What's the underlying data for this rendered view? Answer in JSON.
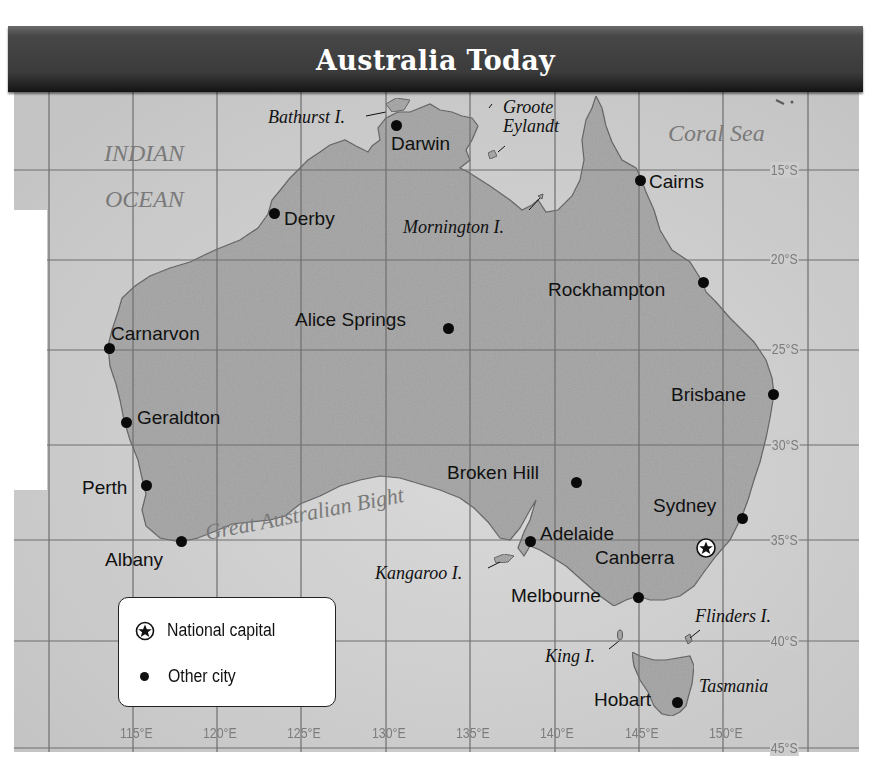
{
  "title": "Australia Today",
  "colors": {
    "land": "#a3a3a3",
    "ocean": "#cdcdcd",
    "grid": "#6e6e6e",
    "title_bar": "#3e3e3e",
    "title_text": "#ffffff",
    "ocean_label": "#7a7a7a"
  },
  "ocean_labels": [
    {
      "id": "indian-ocean-line1",
      "text": "INDIAN"
    },
    {
      "id": "indian-ocean-line2",
      "text": "OCEAN"
    },
    {
      "id": "coral-sea",
      "text": "Coral Sea"
    },
    {
      "id": "great-australian-bight",
      "text": "Great Australian Bight"
    }
  ],
  "cities": [
    {
      "name": "Darwin",
      "type": "other"
    },
    {
      "name": "Derby",
      "type": "other"
    },
    {
      "name": "Cairns",
      "type": "other"
    },
    {
      "name": "Rockhampton",
      "type": "other"
    },
    {
      "name": "Alice Springs",
      "type": "other"
    },
    {
      "name": "Carnarvon",
      "type": "other"
    },
    {
      "name": "Brisbane",
      "type": "other"
    },
    {
      "name": "Geraldton",
      "type": "other"
    },
    {
      "name": "Broken Hill",
      "type": "other"
    },
    {
      "name": "Perth",
      "type": "other"
    },
    {
      "name": "Sydney",
      "type": "other"
    },
    {
      "name": "Adelaide",
      "type": "other"
    },
    {
      "name": "Albany",
      "type": "other"
    },
    {
      "name": "Canberra",
      "type": "capital"
    },
    {
      "name": "Melbourne",
      "type": "other"
    },
    {
      "name": "Hobart",
      "type": "other"
    }
  ],
  "features": [
    {
      "name": "Bathurst I."
    },
    {
      "name": "Groote"
    },
    {
      "name": "Eylandt"
    },
    {
      "name": "Mornington I."
    },
    {
      "name": "Kangaroo I."
    },
    {
      "name": "Flinders I."
    },
    {
      "name": "King I."
    },
    {
      "name": "Tasmania"
    }
  ],
  "longitude_labels": [
    "115°E",
    "120°E",
    "125°E",
    "130°E",
    "135°E",
    "140°E",
    "145°E",
    "150°E"
  ],
  "latitude_labels": [
    "15°S",
    "20°S",
    "25°S",
    "30°S",
    "35°S",
    "40°S",
    "45°S"
  ],
  "legend": {
    "items": [
      {
        "symbol": "star-in-circle",
        "label": "National capital"
      },
      {
        "symbol": "dot",
        "label": "Other city"
      }
    ]
  }
}
